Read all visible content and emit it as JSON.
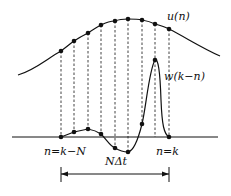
{
  "labels": {
    "u": "u(n)",
    "w": "w(k−n)",
    "start": "n=k−N",
    "end": "n=k",
    "span": "NΔt"
  },
  "colors": {
    "ink": "#111111",
    "background": "#ffffff"
  },
  "samples_x": [
    61,
    74,
    88,
    101,
    115,
    128,
    142,
    155,
    169
  ],
  "u_points_y": [
    51,
    41,
    33,
    25,
    21,
    19,
    20,
    24,
    29
  ],
  "w_points_y": [
    137,
    132,
    129,
    134,
    148,
    152,
    124,
    60,
    137
  ],
  "baseline_y": 137
}
